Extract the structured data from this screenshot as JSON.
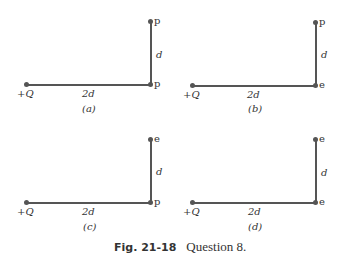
{
  "panels": [
    {
      "id": "a",
      "label": "(a)",
      "charge": "+Q",
      "horizontal_distance": "2d",
      "vertical_distance": "d",
      "corner_particle": "p",
      "top_particle": "p"
    },
    {
      "id": "b",
      "label": "(b)",
      "charge": "+Q",
      "horizontal_distance": "2d",
      "vertical_distance": "d",
      "corner_particle": "e",
      "top_particle": "p"
    },
    {
      "id": "c",
      "label": "(c)",
      "charge": "+Q",
      "horizontal_distance": "2d",
      "vertical_distance": "d",
      "corner_particle": "p",
      "top_particle": "e"
    },
    {
      "id": "d",
      "label": "(d)",
      "charge": "+Q",
      "horizontal_distance": "2d",
      "vertical_distance": "d",
      "corner_particle": "e",
      "top_particle": "e"
    }
  ],
  "caption": {
    "figure": "Fig. 21-18",
    "text": "Question 8."
  }
}
